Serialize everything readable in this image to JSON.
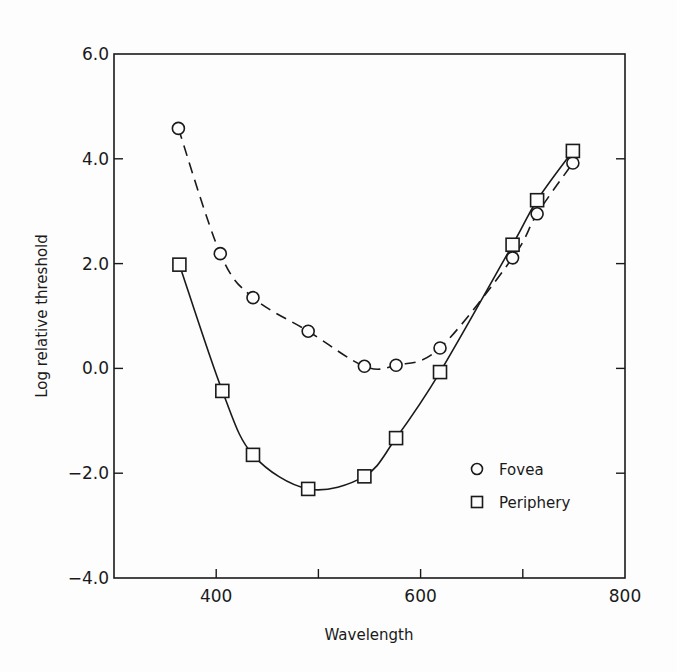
{
  "chart_data": {
    "type": "line",
    "title": "",
    "xlabel": "Wavelength",
    "ylabel": "Log relative threshold",
    "xlim": [
      300,
      800
    ],
    "ylim": [
      -4.0,
      6.0
    ],
    "x_ticks": [
      400,
      500,
      600,
      700,
      800
    ],
    "x_tick_labels": [
      "400",
      "",
      "600",
      "",
      "800"
    ],
    "y_ticks": [
      -4.0,
      -2.0,
      0.0,
      2.0,
      4.0,
      6.0
    ],
    "y_tick_labels": [
      "-4.0",
      "-2.0",
      "0.0",
      "2.0",
      "4.0",
      "6.0"
    ],
    "grid": false,
    "legend_position": "lower right (inside)",
    "series": [
      {
        "name": "Fovea",
        "marker": "circle",
        "line_style": "dashed",
        "x": [
          363,
          404,
          436,
          490,
          545,
          576,
          619,
          690,
          714,
          749
        ],
        "y": [
          4.58,
          2.19,
          1.35,
          0.71,
          0.04,
          0.06,
          0.39,
          2.11,
          2.95,
          3.92
        ]
      },
      {
        "name": "Periphery",
        "marker": "square",
        "line_style": "solid",
        "x": [
          364,
          406,
          436,
          490,
          545,
          576,
          619,
          690,
          714,
          749
        ],
        "y": [
          1.98,
          -0.43,
          -1.65,
          -2.3,
          -2.06,
          -1.33,
          -0.07,
          2.36,
          3.21,
          4.15
        ]
      }
    ]
  }
}
